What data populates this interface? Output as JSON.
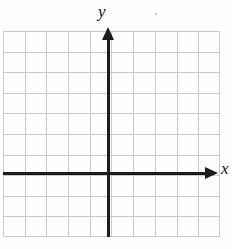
{
  "figure": {
    "title": ""
  },
  "axes": {
    "x_label": "x",
    "y_label": "y"
  },
  "chart_data": {
    "type": "scatter",
    "title": "",
    "xlabel": "x",
    "ylabel": "y",
    "x": [],
    "y": [],
    "series": [],
    "xlim": [
      -5,
      5
    ],
    "ylim": [
      -3,
      7
    ],
    "xticks": [],
    "yticks": [],
    "grid": true,
    "legend": "none",
    "annotations": []
  },
  "colors": {
    "grid_line": "#c9c9c9",
    "axis_line": "#1c1c1c",
    "label_text": "#141414",
    "background": "#fefefe"
  }
}
